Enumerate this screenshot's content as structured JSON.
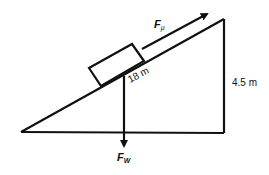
{
  "diagram": {
    "type": "inclined-plane-free-body",
    "labels": {
      "friction_force": "F",
      "friction_subscript": "μ",
      "incline_length": "18 m",
      "height": "4.5 m",
      "weight_force": "F",
      "weight_subscript": "W"
    },
    "colors": {
      "stroke": "#111111",
      "background": "#ffffff"
    }
  }
}
